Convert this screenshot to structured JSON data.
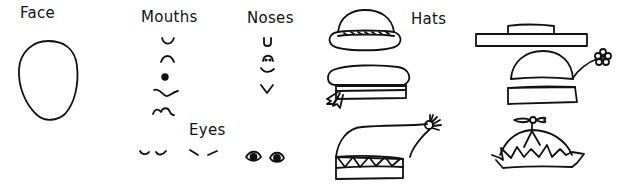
{
  "sections": {
    "face": {
      "label": "Face",
      "items": [
        "oval-face"
      ]
    },
    "mouths": {
      "label": "Mouths",
      "items": [
        "smile",
        "frown",
        "dot",
        "wavy",
        "squiggle"
      ]
    },
    "noses": {
      "label": "Noses",
      "items": [
        "u-nose",
        "dotted-arc-nose",
        "curve-nose",
        "v-nose"
      ]
    },
    "eyes": {
      "label": "Eyes",
      "items": [
        "closed-eyes",
        "slanted-eyes",
        "open-eyes"
      ]
    },
    "hats": {
      "label": "Hats",
      "items": [
        "bowler-hat",
        "sailor-cap",
        "stocking-cap",
        "flat-top-hat",
        "flower-hat",
        "propeller-beanie"
      ]
    }
  },
  "colors": {
    "ink": "#111111",
    "background": "#ffffff"
  }
}
